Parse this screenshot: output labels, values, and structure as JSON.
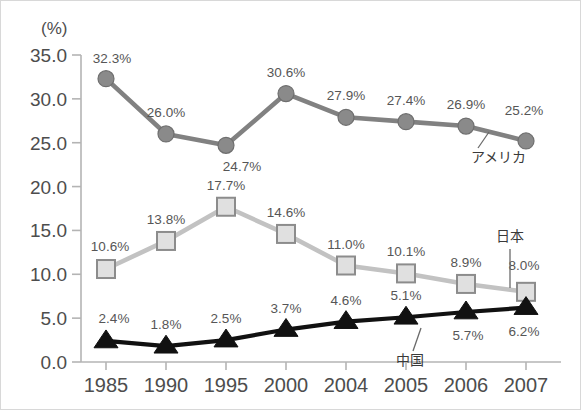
{
  "chart_data": {
    "type": "line",
    "title": "",
    "xlabel": "",
    "ylabel": "",
    "unit_label": "(%)",
    "categories": [
      "1985",
      "1990",
      "1995",
      "2000",
      "2004",
      "2005",
      "2006",
      "2007"
    ],
    "ylim": [
      0.0,
      35.0
    ],
    "yticks": [
      "0.0",
      "5.0",
      "10.0",
      "15.0",
      "20.0",
      "25.0",
      "30.0",
      "35.0"
    ],
    "ytick_values": [
      0.0,
      5.0,
      10.0,
      15.0,
      20.0,
      25.0,
      30.0,
      35.0
    ],
    "grid": false,
    "legend_position": "inline-annotation",
    "series": [
      {
        "name": "アメリカ",
        "marker": "circle",
        "color": "#8a8a8a",
        "line_color": "#818181",
        "values": [
          32.3,
          26.0,
          24.7,
          30.6,
          27.9,
          27.4,
          26.9,
          25.2
        ],
        "labels": [
          "32.3%",
          "26.0%",
          "24.7%",
          "30.6%",
          "27.9%",
          "27.4%",
          "26.9%",
          "25.2%"
        ],
        "label_positions": [
          "above",
          "above",
          "below",
          "above",
          "above",
          "above",
          "above",
          "above"
        ]
      },
      {
        "name": "日本",
        "marker": "square",
        "color": "#e0e0e0",
        "line_color": "#c2c2c2",
        "values": [
          10.6,
          13.8,
          17.7,
          14.6,
          11.0,
          10.1,
          8.9,
          8.0
        ],
        "labels": [
          "10.6%",
          "13.8%",
          "17.7%",
          "14.6%",
          "11.0%",
          "10.1%",
          "8.9%",
          "8.0%"
        ],
        "label_positions": [
          "above",
          "above",
          "above",
          "above",
          "above",
          "above",
          "above",
          "above"
        ]
      },
      {
        "name": "中国",
        "marker": "triangle",
        "color": "#111111",
        "line_color": "#111111",
        "values": [
          2.4,
          1.8,
          2.5,
          3.7,
          4.6,
          5.1,
          5.7,
          6.2
        ],
        "labels": [
          "2.4%",
          "1.8%",
          "2.5%",
          "3.7%",
          "4.6%",
          "5.1%",
          "5.7%",
          "6.2%"
        ],
        "label_positions": [
          "above",
          "above",
          "above",
          "above",
          "above",
          "above",
          "below",
          "below"
        ]
      }
    ],
    "annotations": [
      {
        "text": "アメリカ",
        "series": "アメリカ",
        "anchor_index": 7
      },
      {
        "text": "日本",
        "series": "日本",
        "anchor_index": 7
      },
      {
        "text": "中国",
        "series": "中国",
        "anchor_index": 5
      }
    ]
  }
}
